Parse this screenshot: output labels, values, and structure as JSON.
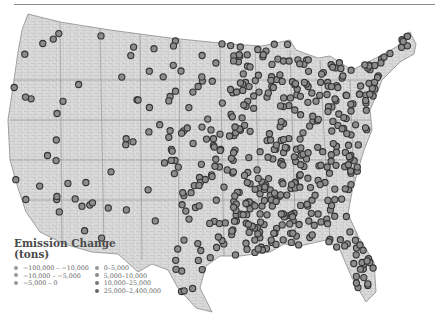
{
  "legend": {
    "title_line1": "Emission Change",
    "title_line2": "(tons)",
    "items": [
      {
        "label": "−100,000 – −10,000",
        "color": "#9a9a9a"
      },
      {
        "label": "−10,000 – −5,000",
        "color": "#9a9a9a"
      },
      {
        "label": "−5,000 – 0",
        "color": "#9a9a9a"
      },
      {
        "label": "0–5,000",
        "color": "#9a9a9a"
      },
      {
        "label": "5,000–10,000",
        "color": "#8a8a8a"
      },
      {
        "label": "10,000–25,000",
        "color": "#777777"
      },
      {
        "label": "25,000–2,400,000",
        "color": "#666666"
      }
    ]
  },
  "colors": {
    "land": "#d9d9d9",
    "county_lines": "#a8a8a8",
    "marker_fill": "#8c8c8c",
    "marker_stroke": "#333333"
  }
}
